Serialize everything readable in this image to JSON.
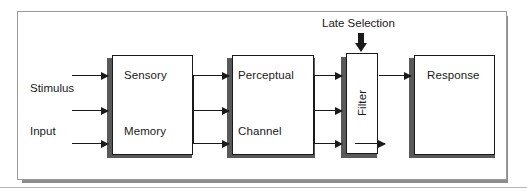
{
  "figure": {
    "annotation": {
      "label": "Late Selection",
      "arrow_icon": "down-arrow-icon"
    },
    "inputs": [
      {
        "label": "Stimulus"
      },
      {
        "label": "Input"
      }
    ],
    "stages": [
      {
        "id": "sensory-memory",
        "lines": [
          "Sensory",
          "Memory"
        ],
        "orientation": "horizontal"
      },
      {
        "id": "perceptual-channel",
        "lines": [
          "Perceptual",
          "Channel"
        ],
        "orientation": "horizontal"
      },
      {
        "id": "filter",
        "lines": [
          "Filter"
        ],
        "orientation": "vertical"
      },
      {
        "id": "response",
        "lines": [
          "Response"
        ],
        "orientation": "horizontal"
      }
    ],
    "colors": {
      "stroke": "#1a1a1a",
      "box_shadow": "#595959",
      "frame": "#9a9a9a",
      "panel_shadow": "#8c8c8c",
      "background": "#ffffff",
      "rule": "#b6b6b6"
    }
  }
}
